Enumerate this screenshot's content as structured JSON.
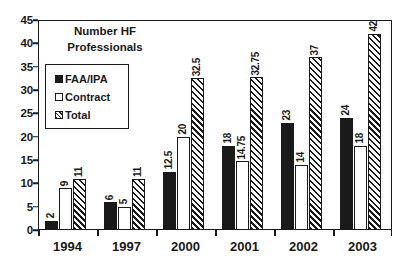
{
  "chart_data": {
    "type": "bar",
    "title": "Number HF Professionals",
    "xlabel": "",
    "ylabel": "",
    "ylim": [
      0,
      45
    ],
    "ytick_step": 5,
    "yticks": [
      0,
      5,
      10,
      15,
      20,
      25,
      30,
      35,
      40,
      45
    ],
    "grid": false,
    "legend_position": "upper-left-inside",
    "categories": [
      "1994",
      "1997",
      "2000",
      "2001",
      "2002",
      "2003"
    ],
    "series": [
      {
        "name": "FAA/IPA",
        "fill": "solid-black",
        "values": [
          2,
          6,
          12.5,
          18,
          23,
          24
        ],
        "labels": [
          "2",
          "6",
          "12.5",
          "18",
          "23",
          "24"
        ]
      },
      {
        "name": "Contract",
        "fill": "white-outline",
        "values": [
          9,
          5,
          20,
          14.75,
          14,
          18
        ],
        "labels": [
          "9",
          "5",
          "20",
          "14.75",
          "14",
          "18"
        ]
      },
      {
        "name": "Total",
        "fill": "diagonal-hatch",
        "values": [
          11,
          11,
          32.5,
          32.75,
          37,
          42
        ],
        "labels": [
          "11",
          "11",
          "32.5",
          "32.75",
          "37",
          "42"
        ]
      }
    ]
  },
  "legend": {
    "items": [
      {
        "label": "FAA/IPA",
        "swatch": "solid-black-swatch"
      },
      {
        "label": "Contract",
        "swatch": "white-outline-swatch"
      },
      {
        "label": "Total",
        "swatch": "hatched-swatch"
      }
    ]
  },
  "colors": {
    "ink": "#1a1a1a",
    "background": "#ffffff"
  }
}
